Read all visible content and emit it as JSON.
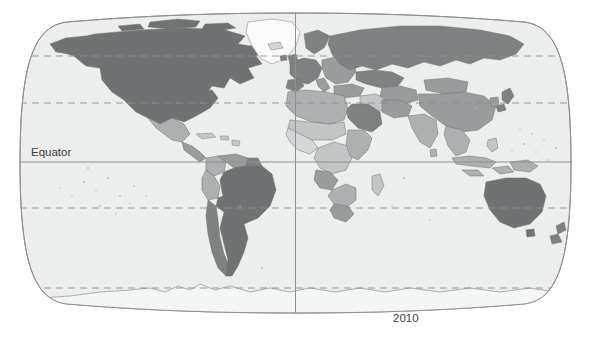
{
  "figure": {
    "type": "world-map",
    "projection": "robinson",
    "year_label": "2010",
    "equator_label": "Equator",
    "background_color": "#ffffff"
  },
  "map": {
    "ocean_color": "#eceded",
    "outline_color": "#8d8f90",
    "graticule_color": "#8d8f90",
    "country_border_color": "#6e7071",
    "shade_classes": [
      {
        "name": "very-dark",
        "color": "#6f7172"
      },
      {
        "name": "dark",
        "color": "#7e8182"
      },
      {
        "name": "medium",
        "color": "#999c9d"
      },
      {
        "name": "light-medium",
        "color": "#adb0b1"
      },
      {
        "name": "light",
        "color": "#c2c4c5"
      },
      {
        "name": "very-light",
        "color": "#d4d6d7"
      },
      {
        "name": "no-data",
        "color": "#eceded"
      }
    ],
    "graticule": {
      "equator_line": "solid",
      "tropic_lines": "dashed",
      "polar_lines": "dashed",
      "central_meridian": "solid"
    },
    "regions": [
      {
        "name": "canada",
        "shade": "very-dark"
      },
      {
        "name": "united-states",
        "shade": "very-dark"
      },
      {
        "name": "greenland",
        "shade": "no-data"
      },
      {
        "name": "mexico",
        "shade": "light-medium"
      },
      {
        "name": "central-america",
        "shade": "medium"
      },
      {
        "name": "caribbean",
        "shade": "light"
      },
      {
        "name": "colombia",
        "shade": "light-medium"
      },
      {
        "name": "venezuela",
        "shade": "medium"
      },
      {
        "name": "brazil",
        "shade": "very-dark"
      },
      {
        "name": "peru",
        "shade": "light-medium"
      },
      {
        "name": "bolivia",
        "shade": "medium"
      },
      {
        "name": "chile",
        "shade": "dark"
      },
      {
        "name": "argentina",
        "shade": "very-dark"
      },
      {
        "name": "western-europe",
        "shade": "dark"
      },
      {
        "name": "eastern-europe",
        "shade": "medium"
      },
      {
        "name": "russia",
        "shade": "dark"
      },
      {
        "name": "turkey",
        "shade": "medium"
      },
      {
        "name": "middle-east",
        "shade": "light"
      },
      {
        "name": "saudi-arabia",
        "shade": "dark"
      },
      {
        "name": "north-africa",
        "shade": "light-medium"
      },
      {
        "name": "sahel",
        "shade": "light"
      },
      {
        "name": "west-africa",
        "shade": "very-light"
      },
      {
        "name": "central-africa",
        "shade": "light"
      },
      {
        "name": "east-africa",
        "shade": "light-medium"
      },
      {
        "name": "southern-africa",
        "shade": "medium"
      },
      {
        "name": "south-africa",
        "shade": "medium"
      },
      {
        "name": "madagascar",
        "shade": "light"
      },
      {
        "name": "central-asia",
        "shade": "medium"
      },
      {
        "name": "china",
        "shade": "medium"
      },
      {
        "name": "mongolia",
        "shade": "medium"
      },
      {
        "name": "india",
        "shade": "light-medium"
      },
      {
        "name": "southeast-asia",
        "shade": "light-medium"
      },
      {
        "name": "indonesia",
        "shade": "light-medium"
      },
      {
        "name": "japan",
        "shade": "dark"
      },
      {
        "name": "korea",
        "shade": "medium"
      },
      {
        "name": "australia",
        "shade": "very-dark"
      },
      {
        "name": "new-zealand",
        "shade": "dark"
      },
      {
        "name": "antarctica",
        "shade": "no-data"
      }
    ]
  }
}
